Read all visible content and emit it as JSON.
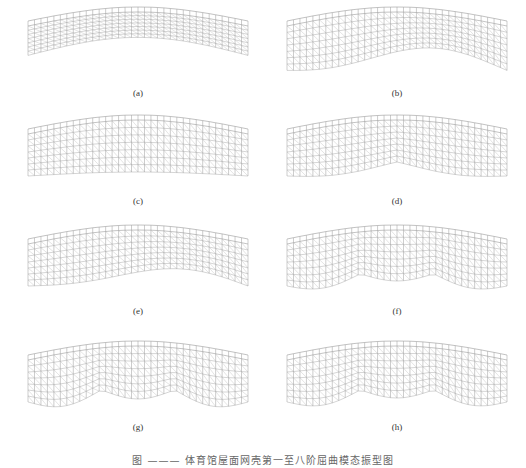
{
  "figure": {
    "panels": [
      {
        "label": "(a)",
        "mode": "arch"
      },
      {
        "label": "(b)",
        "mode": "s-wave"
      },
      {
        "label": "(c)",
        "mode": "single-bulge"
      },
      {
        "label": "(d)",
        "mode": "double-wave"
      },
      {
        "label": "(e)",
        "mode": "double-wave-b"
      },
      {
        "label": "(f)",
        "mode": "triple-wave"
      },
      {
        "label": "(g)",
        "mode": "triple-wave-b"
      },
      {
        "label": "(h)",
        "mode": "triple-wave-c"
      }
    ],
    "caption": "图 ——— 体育馆屋面网壳第一至八阶屈曲模态振型图"
  }
}
